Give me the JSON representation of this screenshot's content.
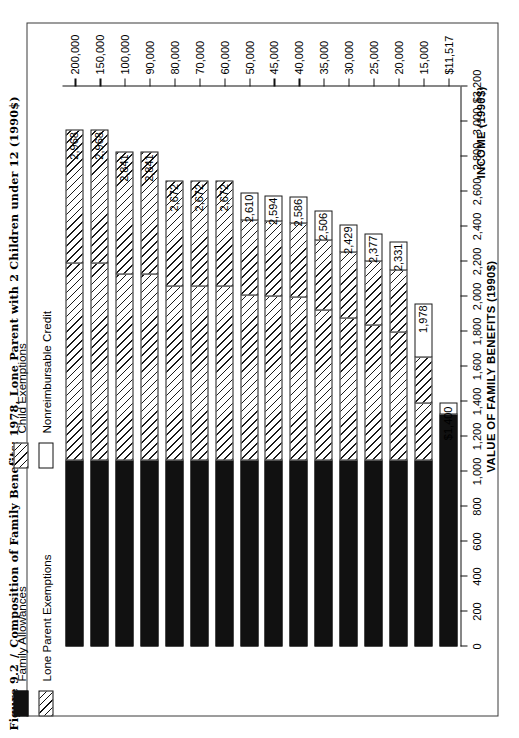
{
  "caption": {
    "figure_number": "Figure 9.2",
    "separator": "/",
    "title": "Composition of Family Benefits: 1978, Lone Parent with 2 Children under 12 (1990$)"
  },
  "legend": {
    "column1": [
      {
        "label": "Family Allowances",
        "swatch": "black"
      },
      {
        "label": "Lone Parent Exemptions",
        "swatch": "hatch"
      }
    ],
    "column2": [
      {
        "label": "Child Exemptions",
        "swatch": "hatch"
      },
      {
        "label": "Nonreimbursable Credit",
        "swatch": "white"
      }
    ]
  },
  "axes": {
    "value_axis_title": "VALUE OF FAMILY BENEFITS (1990$)",
    "category_axis_title": "INCOME (1990$)",
    "value_ticks": [
      "0",
      "200",
      "400",
      "600",
      "800",
      "1,000",
      "1,200",
      "1,400",
      "1,600",
      "1,800",
      "2,000",
      "2,200",
      "2,400",
      "2,600",
      "2,800",
      "3,000",
      "$3,200"
    ]
  },
  "chart_data": {
    "type": "bar",
    "orientation": "horizontal-stacked",
    "title": "Composition of Family Benefits: 1978, Lone Parent with 2 Children under 12 (1990$)",
    "xlabel": "VALUE OF FAMILY BENEFITS (1990$)",
    "ylabel": "INCOME (1990$)",
    "xlim": [
      0,
      3200
    ],
    "grid": false,
    "legend_position": "top-left",
    "categories": [
      "$11,517",
      "15,000",
      "20,000",
      "25,000",
      "30,000",
      "35,000",
      "40,000",
      "45,000",
      "50,000",
      "60,000",
      "70,000",
      "80,000",
      "90,000",
      "100,000",
      "150,000",
      "200,000"
    ],
    "series": [
      {
        "name": "Family Allowances",
        "swatch": "black",
        "values": [
          1330,
          1066,
          1066,
          1066,
          1066,
          1066,
          1066,
          1066,
          1066,
          1066,
          1066,
          1066,
          1066,
          1066,
          1066,
          1066
        ]
      },
      {
        "name": "Lone Parent Exemptions",
        "swatch": "hatch",
        "values": [
          0,
          332,
          740,
          780,
          820,
          868,
          940,
          944,
          950,
          1002,
          1002,
          1002,
          1070,
          1070,
          1132,
          1132
        ]
      },
      {
        "name": "Child Exemptions",
        "swatch": "hatch",
        "values": [
          0,
          270,
          361,
          373,
          385,
          404,
          430,
          434,
          438,
          604,
          604,
          604,
          705,
          705,
          770,
          770
        ]
      },
      {
        "name": "Nonreimbursable Credit",
        "swatch": "white",
        "values": [
          70,
          310,
          164,
          158,
          158,
          168,
          150,
          150,
          156,
          0,
          0,
          0,
          0,
          0,
          0,
          0
        ]
      }
    ],
    "totals": [
      "$1,400",
      "1,978",
      "2,331",
      "2,377",
      "2,429",
      "2,506",
      "2,586",
      "2,594",
      "2,610",
      "2,672",
      "2,672",
      "2,672",
      "2,841",
      "2,841",
      "2,968",
      "2,968"
    ],
    "total_values": [
      1400,
      1978,
      2331,
      2377,
      2429,
      2506,
      2586,
      2594,
      2610,
      2672,
      2672,
      2672,
      2841,
      2841,
      2968,
      2968
    ]
  }
}
